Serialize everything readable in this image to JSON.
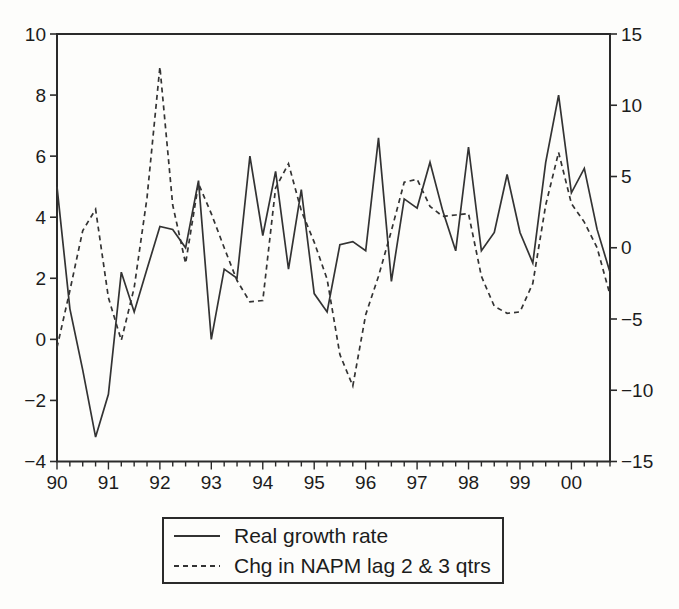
{
  "figure": {
    "background": "#fdfdfb",
    "line_color": "#333333",
    "axis_color": "#2a2a2a"
  },
  "legend": {
    "series1_label": "Real growth rate",
    "series2_label": "Chg in NAPM lag 2 & 3 qtrs"
  },
  "chart_data": {
    "type": "line",
    "title": "",
    "xlabel": "",
    "ylabel_left": "",
    "ylabel_right": "",
    "x_unit": "quarterly",
    "x_start_year": 1990,
    "x_year_tick_labels": [
      "90",
      "91",
      "92",
      "93",
      "94",
      "95",
      "96",
      "97",
      "98",
      "99",
      "00"
    ],
    "left_axis": {
      "min": -4,
      "max": 10,
      "tick_labels": [
        10,
        8,
        6,
        4,
        2,
        0,
        -2,
        -4
      ]
    },
    "right_axis": {
      "min": -15,
      "max": 15,
      "tick_labels": [
        15,
        10,
        5,
        0,
        -5,
        -10,
        -15
      ]
    },
    "grid": false,
    "legend_position": "bottom-center",
    "series": [
      {
        "name": "Real growth rate",
        "axis": "left",
        "style": "solid",
        "values": [
          5.0,
          1.0,
          -1.0,
          -3.2,
          -1.8,
          2.2,
          0.9,
          2.3,
          3.7,
          3.6,
          3.0,
          5.2,
          0.0,
          2.3,
          2.0,
          6.0,
          3.4,
          5.5,
          2.3,
          4.9,
          1.5,
          0.9,
          3.1,
          3.2,
          2.9,
          6.6,
          1.9,
          4.6,
          4.3,
          5.8,
          4.2,
          2.9,
          6.3,
          2.9,
          3.5,
          5.4,
          3.5,
          2.5,
          5.8,
          8.0,
          4.8,
          5.6,
          3.6,
          2.2
        ]
      },
      {
        "name": "Chg in NAPM lag 2 & 3 qtrs",
        "axis": "right",
        "style": "dashed",
        "values": [
          -7.0,
          -3.0,
          1.2,
          2.7,
          -3.5,
          -6.5,
          -2.8,
          3.5,
          12.7,
          3.0,
          -1.1,
          4.5,
          2.4,
          0.0,
          -2.3,
          -3.8,
          -3.7,
          4.2,
          5.9,
          2.6,
          0.4,
          -2.2,
          -7.5,
          -9.7,
          -4.7,
          -2.0,
          1.2,
          4.6,
          4.8,
          2.9,
          2.2,
          2.3,
          2.4,
          -2.0,
          -4.1,
          -4.6,
          -4.5,
          -2.5,
          3.0,
          6.7,
          3.1,
          1.8,
          0.0,
          -3.3
        ]
      }
    ]
  }
}
